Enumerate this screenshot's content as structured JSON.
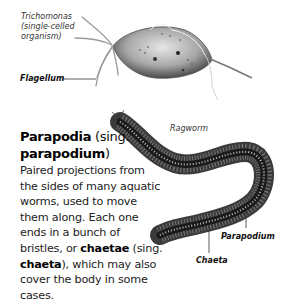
{
  "trichomonas": {
    "caption_line1": "Trichomonas",
    "caption_line2": "(single-celled",
    "caption_line3": "organism)",
    "label_flagellum": "Flagellum"
  },
  "ragworm": {
    "caption": "Ragworm",
    "label_parapodium": "Parapodium",
    "label_chaeta": "Chaeta"
  },
  "definition": {
    "term": "Parapodia",
    "sing_open": " (sing.",
    "term_singular": "parapodium",
    "sing_close": ")",
    "body_part1": "Paired projections from the sides of many aquatic worms, used to move them along. Each one ends in a bunch of bristles, or ",
    "term_chaetae": "chaetae",
    "body_part2": " (sing. ",
    "term_chaeta": "chaeta",
    "body_part3": "), which may also cover the body in some cases."
  },
  "colors": {
    "background": "#ffffff",
    "text": "#222222",
    "illustration_dark": "#2a2a2a",
    "illustration_mid": "#8a8a8a",
    "illustration_light": "#d8d8d8"
  }
}
